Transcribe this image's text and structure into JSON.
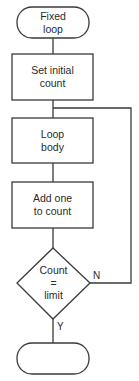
{
  "diagram": {
    "type": "flowchart",
    "title": "Fixed loop",
    "colors": {
      "stroke": "#3a3a3a",
      "fill": "#ffffff",
      "text": "#2a2a2a"
    },
    "nodes": [
      {
        "id": "start",
        "shape": "terminal",
        "lines": [
          "Fixed",
          "loop"
        ]
      },
      {
        "id": "init",
        "shape": "process",
        "lines": [
          "Set initial",
          "count"
        ]
      },
      {
        "id": "body",
        "shape": "process",
        "lines": [
          "Loop",
          "body"
        ]
      },
      {
        "id": "increment",
        "shape": "process",
        "lines": [
          "Add one",
          "to count"
        ]
      },
      {
        "id": "check",
        "shape": "decision",
        "lines": [
          "Count",
          "=",
          "limit"
        ]
      },
      {
        "id": "end",
        "shape": "terminal",
        "lines": []
      }
    ],
    "edges": [
      {
        "from": "start",
        "to": "init",
        "label": ""
      },
      {
        "from": "init",
        "to": "body",
        "label": ""
      },
      {
        "from": "body",
        "to": "increment",
        "label": ""
      },
      {
        "from": "increment",
        "to": "check",
        "label": ""
      },
      {
        "from": "check",
        "to": "body",
        "label": "N"
      },
      {
        "from": "check",
        "to": "end",
        "label": "Y"
      }
    ]
  }
}
